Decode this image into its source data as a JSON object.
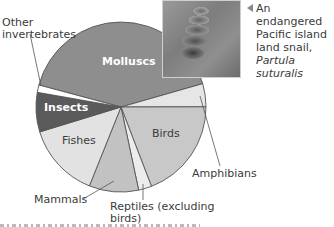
{
  "chart_data": {
    "type": "pie",
    "title": "",
    "center": [
      121,
      107
    ],
    "radius": 85,
    "start_angle_deg": 165,
    "direction": "clockwise",
    "slices": [
      {
        "label": "Molluscs",
        "value": 41.4,
        "color": "#8e8e8e",
        "label_inside": true
      },
      {
        "label": "Amphibians",
        "value": 4.4,
        "color": "#e6e6e6",
        "label_inside": false
      },
      {
        "label": "Birds",
        "value": 19.2,
        "color": "#c8c8c8",
        "label_inside": true
      },
      {
        "label": "Reptiles (excluding birds)",
        "value": 2.5,
        "color": "#ececec",
        "label_inside": false
      },
      {
        "label": "Mammals",
        "value": 9.4,
        "color": "#c2c2c2",
        "label_inside": false
      },
      {
        "label": "Fishes",
        "value": 14.2,
        "color": "#e2e2e2",
        "label_inside": true
      },
      {
        "label": "Insects",
        "value": 7.5,
        "color": "#5a5a5a",
        "label_inside": true
      },
      {
        "label": "Other invertebrates",
        "value": 1.4,
        "color": "#ffffff",
        "label_inside": false
      }
    ],
    "legend": "none",
    "stroke_color": "#555555"
  },
  "labels": {
    "molluscs": "Molluscs",
    "insects": "Insects",
    "fishes": "Fishes",
    "birds": "Birds",
    "amphibians": "Amphibians",
    "mammals": "Mammals",
    "reptiles_line1": "Reptiles (excluding",
    "reptiles_line2": "birds)",
    "other_line1": "Other",
    "other_line2": "invertebrates"
  },
  "photo": {
    "caption_line1": "An endangered",
    "caption_line2": "Pacific island",
    "caption_line3": "land snail,",
    "caption_line4": "Partula suturalis",
    "pointer": "left-triangle"
  }
}
